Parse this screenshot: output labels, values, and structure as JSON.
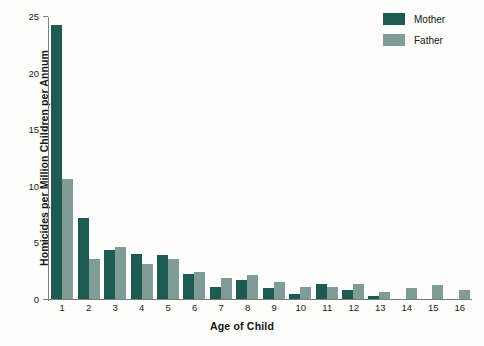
{
  "chart_data": {
    "type": "bar",
    "title": "",
    "xlabel": "Age of Child",
    "ylabel": "Homicides per Million Children per Annum",
    "categories": [
      "1",
      "2",
      "3",
      "4",
      "5",
      "6",
      "7",
      "8",
      "9",
      "10",
      "11",
      "12",
      "13",
      "14",
      "15",
      "16"
    ],
    "yticks": [
      0,
      5,
      10,
      15,
      20,
      25
    ],
    "ylim": [
      0,
      25
    ],
    "grid": false,
    "legend_position": "top-right",
    "series": [
      {
        "name": "Mother",
        "color": "#1d5b52",
        "values": [
          24.2,
          7.2,
          4.3,
          4.0,
          3.9,
          2.2,
          1.1,
          1.7,
          1.0,
          0.4,
          1.3,
          0.8,
          0.3,
          0,
          0,
          0
        ]
      },
      {
        "name": "Father",
        "color": "#7f9c96",
        "values": [
          10.6,
          3.5,
          4.6,
          3.1,
          3.5,
          2.4,
          1.9,
          2.1,
          1.5,
          1.1,
          1.1,
          1.3,
          0.6,
          1.0,
          1.2,
          0.8
        ]
      }
    ]
  },
  "legend": {
    "items": [
      {
        "label": "Mother",
        "color": "#1d5b52"
      },
      {
        "label": "Father",
        "color": "#7f9c96"
      }
    ]
  }
}
